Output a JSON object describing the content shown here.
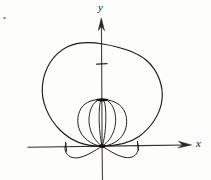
{
  "figure": {
    "kind": "hand-drawn polar plot sketch",
    "background_color": "#fdfdfb",
    "ink_color": "#1a1713",
    "axis_color": "#3a3631",
    "axes": {
      "x_axis": {
        "label": "x",
        "label_style": "italic",
        "y_position_px": 146,
        "x_start_px": 28,
        "x_end_px": 192,
        "arrow": "right",
        "ticks": [
          {
            "x_px": 66,
            "name": "x-tick-left"
          },
          {
            "x_px": 138,
            "name": "x-tick-right"
          }
        ]
      },
      "y_axis": {
        "label": "y",
        "label_style": "italic",
        "x_position_px": 102,
        "y_start_px": 18,
        "y_end_px": 180,
        "arrow": "up",
        "ticks": [
          {
            "y_px": 64,
            "name": "y-tick-upper"
          }
        ]
      },
      "origin": {
        "x_px": 102,
        "y_px": 146
      }
    },
    "curves": [
      {
        "name": "outer-cardioid",
        "description": "large upward cardioid through origin, apex near top of y-axis",
        "apex_y_px": 44,
        "left_extent_x_px": 42,
        "right_extent_x_px": 163,
        "stroke_width": 1.1
      },
      {
        "name": "inner-circle",
        "description": "medium circle tangent at origin, top at inner node",
        "top_y_px": 100,
        "left_extent_x_px": 78,
        "right_extent_x_px": 127,
        "stroke_width": 1.0
      },
      {
        "name": "inner-petal-left",
        "description": "narrow oval petal inside the circle, leaning left",
        "stroke_width": 1.0
      },
      {
        "name": "inner-petal-right",
        "description": "narrow oval petal inside the circle, leaning right",
        "stroke_width": 1.0
      },
      {
        "name": "lower-lobe-left",
        "description": "small lobe below x-axis to the left of origin",
        "left_extent_x_px": 66,
        "depth_y_px": 158,
        "stroke_width": 1.0
      },
      {
        "name": "lower-lobe-right",
        "description": "small lobe below x-axis to the right of origin",
        "right_extent_x_px": 138,
        "depth_y_px": 158,
        "stroke_width": 1.0
      }
    ],
    "markers": [
      {
        "name": "origin-node",
        "x_px": 102,
        "y_px": 146,
        "note": "dark intersection blob where all curves meet"
      },
      {
        "name": "inner-node",
        "x_px": 102,
        "y_px": 100,
        "note": "dark blob at top of inner circle"
      }
    ]
  }
}
